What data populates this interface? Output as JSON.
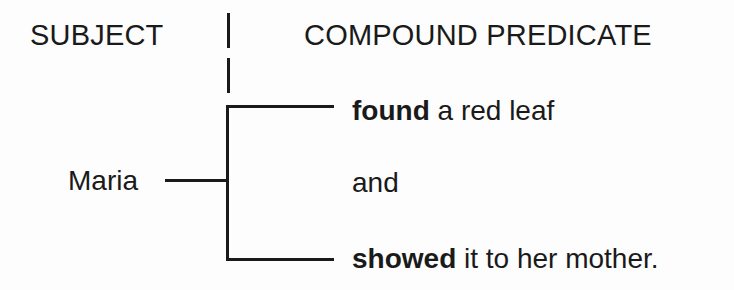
{
  "diagram": {
    "type": "compound-predicate-bracket-diagram",
    "headers": {
      "subject": "SUBJECT",
      "predicate": "COMPOUND PREDICATE"
    },
    "subject": {
      "text": "Maria"
    },
    "predicate_parts": [
      {
        "verb": "found",
        "rest": " a red leaf"
      },
      {
        "conjunction": "and"
      },
      {
        "verb": "showed",
        "rest": " it to her mother."
      }
    ],
    "colors": {
      "ink": "#1a1a1a",
      "paper": "#fdfdfd"
    }
  }
}
